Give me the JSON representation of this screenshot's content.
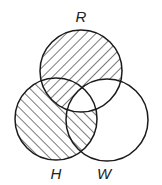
{
  "diagram": {
    "type": "venn",
    "sets": [
      {
        "id": "R",
        "label": "R",
        "cx": 81,
        "cy": 71,
        "r": 41,
        "label_x": 81,
        "label_y": 22
      },
      {
        "id": "H",
        "label": "H",
        "cx": 56,
        "cy": 119,
        "r": 41,
        "label_x": 56,
        "label_y": 179
      },
      {
        "id": "W",
        "label": "W",
        "cx": 107,
        "cy": 120,
        "r": 41,
        "label_x": 104,
        "label_y": 179
      }
    ],
    "shaded_regions": [
      {
        "region": "R only",
        "hatch": "backslash"
      },
      {
        "region": "R∩H not W",
        "hatch": "backslash"
      },
      {
        "region": "H only",
        "hatch": "slash"
      },
      {
        "region": "H∩W not R",
        "hatch": "slash"
      }
    ],
    "unshaded_regions": [
      "R∩H∩W",
      "R∩W not H",
      "W only"
    ],
    "colors": {
      "stroke": "#1a1a1a",
      "hatch": "#333333",
      "background": "#ffffff"
    }
  }
}
